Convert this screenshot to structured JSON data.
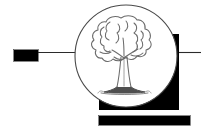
{
  "artwork": {
    "title": "Tree Emblem Logo",
    "kind": "logo-mark",
    "description": "Hand-drawn deciduous tree inside a white circle overlapping a black square, with black accent bars and rules",
    "background_color": "#ffffff",
    "ink_color": "#000000",
    "sketch_color": "#5a5a5a",
    "elements": {
      "left_bar": {
        "name": "left-accent-bar",
        "shape": "rectangle",
        "fill": "#000000",
        "x": 14,
        "y": 50,
        "width": 24,
        "height": 11
      },
      "left_rule": {
        "name": "left-horizontal-rule",
        "shape": "line",
        "stroke": "#000000",
        "x1": 38,
        "y1": 52,
        "x2": 76,
        "y2": 52,
        "stroke_width": 1
      },
      "right_square": {
        "name": "right-black-square",
        "shape": "rectangle",
        "fill": "#000000",
        "x": 99,
        "y": 34,
        "width": 80,
        "height": 76
      },
      "right_rule": {
        "name": "right-horizontal-rule",
        "shape": "line",
        "stroke": "#000000",
        "x1": 179,
        "y1": 52,
        "x2": 201,
        "y2": 52,
        "stroke_width": 1
      },
      "bottom_bar": {
        "name": "bottom-accent-bar",
        "shape": "rectangle",
        "fill": "#000000",
        "x": 99,
        "y": 116,
        "width": 91,
        "height": 9
      },
      "circle": {
        "name": "white-circle-medallion",
        "shape": "circle",
        "fill": "#ffffff",
        "stroke": "#4a4a4a",
        "cx": 126,
        "cy": 56,
        "r": 51,
        "stroke_width": 1
      },
      "tree": {
        "name": "tree-sketch",
        "style": "pencil-sketch",
        "stroke": "#6b6b6b",
        "canopy_top": 16,
        "canopy_bottom": 62,
        "trunk_x": 124,
        "trunk_top": 52,
        "ground_y": 92
      }
    }
  }
}
